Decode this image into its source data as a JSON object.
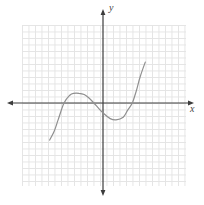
{
  "figure": {
    "x_axis_label": "x",
    "y_axis_label": "y",
    "colors": {
      "background": "#ffffff",
      "grid": "#e4e4e4",
      "axis": "#3c3c3c",
      "curve": "#8f8f8f",
      "label": "#444444"
    }
  },
  "chart_data": {
    "type": "line",
    "title": "",
    "xlabel": "x",
    "ylabel": "y",
    "grid": true,
    "axis_tick_labels": "none",
    "x_intercepts": [
      -6.0,
      -1.4,
      4.5
    ],
    "local_max": {
      "x": -3.7,
      "y": 1.5
    },
    "local_min": {
      "x": 2.0,
      "y": -2.6
    },
    "xlim": [
      -12.5,
      12.5
    ],
    "ylim": [
      -12,
      12
    ],
    "series": [
      {
        "name": "cubic-curve",
        "points": [
          [
            -8.2,
            -5.7
          ],
          [
            -7.5,
            -4.3
          ],
          [
            -6.9,
            -2.6
          ],
          [
            -6.0,
            0.0
          ],
          [
            -5.1,
            1.2
          ],
          [
            -4.5,
            1.5
          ],
          [
            -3.7,
            1.5
          ],
          [
            -2.9,
            1.3
          ],
          [
            -2.2,
            0.8
          ],
          [
            -1.4,
            0.0
          ],
          [
            -0.6,
            -0.9
          ],
          [
            0.2,
            -1.7
          ],
          [
            1.1,
            -2.4
          ],
          [
            2.0,
            -2.6
          ],
          [
            3.1,
            -2.2
          ],
          [
            3.8,
            -1.1
          ],
          [
            4.5,
            0.0
          ],
          [
            5.1,
            1.8
          ],
          [
            5.7,
            4.0
          ],
          [
            6.5,
            6.3
          ]
        ]
      }
    ],
    "layout": {
      "origin_px": [
        103,
        103
      ],
      "unit_px": 6.5
    }
  }
}
